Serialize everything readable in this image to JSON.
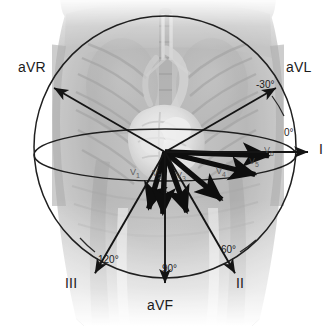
{
  "figure": {
    "width": 336,
    "height": 326,
    "origin": {
      "x": 165,
      "y": 152
    },
    "background": {
      "name": "thorax-radiograph",
      "description": "Grayscale semi-transparent anterior thorax radiograph showing ribs, lungs, mediastinum and heart",
      "colors": {
        "paper": "#ffffff",
        "soft_tissue_dark": "#8e8e8e",
        "soft_tissue_mid": "#a8a8a8",
        "soft_tissue_light": "#c9c9c9",
        "heart": "#efefef",
        "outline": "#1b1b1b"
      }
    },
    "planes": [
      {
        "name": "frontal-plane-circle",
        "type": "circle",
        "cx": 165,
        "cy": 147,
        "r": 131
      },
      {
        "name": "transverse-plane-ellipse",
        "type": "ellipse",
        "cx": 165,
        "cy": 155,
        "rx": 131,
        "ry": 26
      }
    ],
    "limb_leads": [
      {
        "name": "aVR",
        "label": "aVR",
        "angle_deg": -150,
        "label_x": 18,
        "label_y": 60,
        "arrow_len": 128
      },
      {
        "name": "aVL",
        "label": "aVL",
        "angle_deg": -30,
        "label_x": 286,
        "label_y": 60,
        "arrow_len": 128
      },
      {
        "name": "I",
        "label": "I",
        "angle_deg": 0,
        "label_x": 319,
        "label_y": 142,
        "arrow_len": 143
      },
      {
        "name": "II",
        "label": "II",
        "angle_deg": 60,
        "label_x": 236,
        "label_y": 276,
        "arrow_len": 140
      },
      {
        "name": "aVF",
        "label": "aVF",
        "angle_deg": 90,
        "label_x": 147,
        "label_y": 298,
        "arrow_len": 131
      },
      {
        "name": "III",
        "label": "III",
        "angle_deg": 120,
        "label_x": 65,
        "label_y": 276,
        "arrow_len": 140
      }
    ],
    "angle_labels": [
      {
        "name": "angle-minus-30",
        "label": "-30°",
        "x": 256,
        "y": 80
      },
      {
        "name": "angle-0",
        "label": "0°",
        "x": 284,
        "y": 128
      },
      {
        "name": "angle-60",
        "label": "60°",
        "x": 221,
        "y": 245
      },
      {
        "name": "angle-90",
        "label": "90°",
        "x": 162,
        "y": 264
      },
      {
        "name": "angle-120",
        "label": "120°",
        "x": 98,
        "y": 255
      }
    ],
    "precordial_leads": [
      {
        "name": "V1",
        "label": "V",
        "sub": "1",
        "angle_deg": 106,
        "len": 59,
        "label_x": 130,
        "label_y": 168
      },
      {
        "name": "V2",
        "label": "V",
        "sub": "2",
        "angle_deg": 92,
        "len": 62,
        "label_x": 152,
        "label_y": 169
      },
      {
        "name": "V3",
        "label": "V",
        "sub": "3",
        "angle_deg": 70,
        "len": 64,
        "label_x": 176,
        "label_y": 171
      },
      {
        "name": "V4",
        "label": "V",
        "sub": "4",
        "angle_deg": 40,
        "len": 74,
        "label_x": 216,
        "label_y": 167
      },
      {
        "name": "V5",
        "label": "V",
        "sub": "5",
        "angle_deg": 14,
        "len": 93,
        "label_x": 249,
        "label_y": 157
      },
      {
        "name": "V6",
        "label": "V",
        "sub": "6",
        "angle_deg": 2,
        "len": 104,
        "label_x": 264,
        "label_y": 146
      }
    ]
  }
}
